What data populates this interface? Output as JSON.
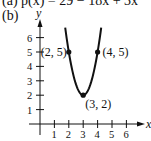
{
  "header": {
    "part_a": "(a) p(x) = 29 − 18x + 3x",
    "part_b": "(b)"
  },
  "chart_data": {
    "type": "line",
    "xlabel": "x",
    "ylabel": "y",
    "xlim": [
      0,
      7
    ],
    "ylim": [
      0,
      7
    ],
    "x_ticks": [
      "1",
      "2",
      "3",
      "4",
      "5",
      "6"
    ],
    "y_ticks": [
      "1",
      "2",
      "3",
      "4",
      "5",
      "6"
    ],
    "grid": false,
    "legend": null,
    "series": [
      {
        "name": "p(x)",
        "x": [
          1.75,
          2,
          2.5,
          3,
          3.5,
          4,
          4.25
        ],
        "values": [
          6.69,
          5,
          2.75,
          2,
          2.75,
          5,
          6.69
        ]
      }
    ],
    "annotations": [
      {
        "label": "(2, 5)",
        "x": 2,
        "y": 5
      },
      {
        "label": "(4, 5)",
        "x": 4,
        "y": 5
      },
      {
        "label": "(3, 2)",
        "x": 3,
        "y": 2
      }
    ]
  },
  "colors": {
    "curve": "#111111",
    "axis": "#111111",
    "background": "#ffffff"
  }
}
